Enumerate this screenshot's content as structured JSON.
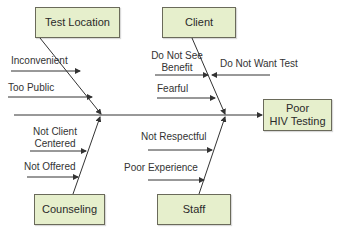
{
  "effect": {
    "label_line1": "Poor",
    "label_line2": "HIV Testing"
  },
  "categories": [
    {
      "name": "Test Location",
      "causes": [
        "Inconvenient",
        "Too Public"
      ]
    },
    {
      "name": "Client",
      "causes": [
        "Do Not See Benefit",
        "Do Not Want Test",
        "Fearful"
      ]
    },
    {
      "name": "Counseling",
      "causes": [
        "Not Client Centered",
        "Not Offered"
      ]
    },
    {
      "name": "Staff",
      "causes": [
        "Not Respectful",
        "Poor Experience"
      ]
    }
  ],
  "labels": {
    "inconvenient": "Inconvenient",
    "too_public": "Too Public",
    "do_not_see_1": "Do Not See",
    "do_not_see_2": "Benefit",
    "do_not_want": "Do Not Want Test",
    "fearful": "Fearful",
    "not_client_1": "Not Client",
    "not_client_2": "Centered",
    "not_offered": "Not Offered",
    "not_respectful": "Not Respectful",
    "poor_experience": "Poor Experience"
  },
  "colors": {
    "box_fill": "#e6efcc",
    "line": "#333333"
  }
}
